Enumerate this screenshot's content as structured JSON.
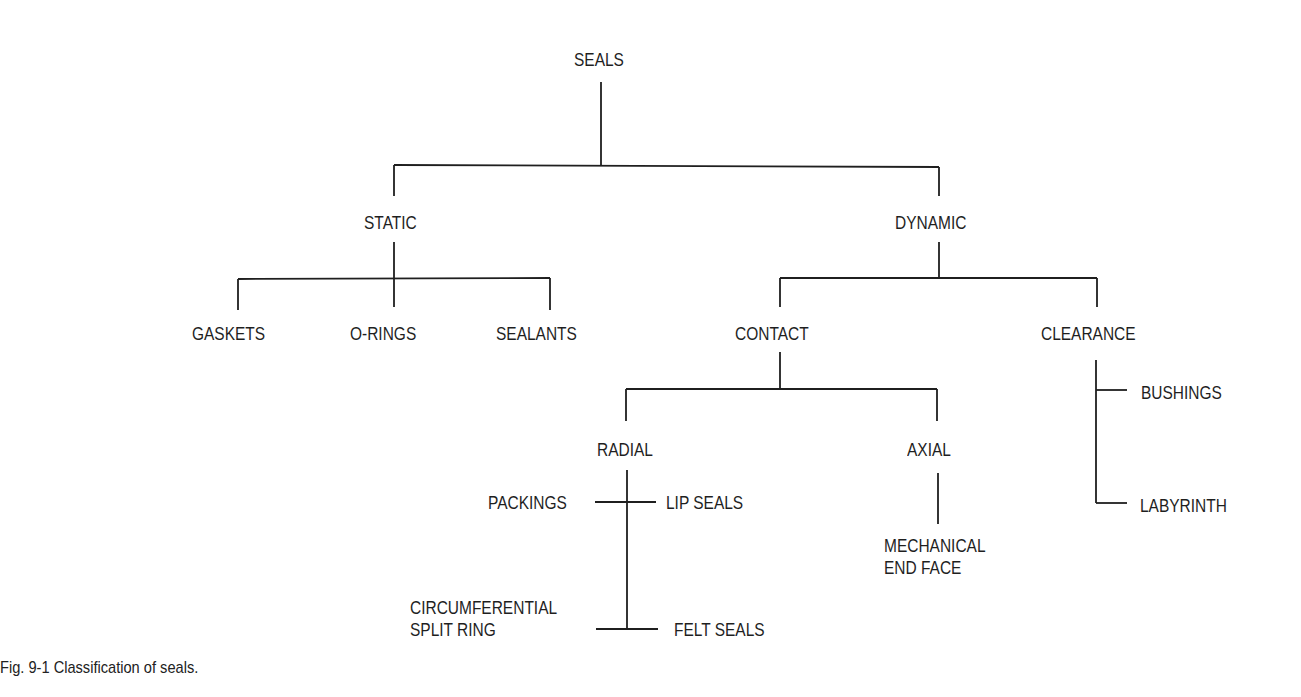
{
  "diagram": {
    "type": "tree",
    "root": "SEALS",
    "nodes": {
      "seals": "SEALS",
      "static": "STATIC",
      "dynamic": "DYNAMIC",
      "gaskets": "GASKETS",
      "o_rings": "O-RINGS",
      "sealants": "SEALANTS",
      "contact": "CONTACT",
      "clearance": "CLEARANCE",
      "radial": "RADIAL",
      "axial": "AXIAL",
      "bushings": "BUSHINGS",
      "labyrinth": "LABYRINTH",
      "packings": "PACKINGS",
      "lip_seals": "LIP SEALS",
      "circumferential_line1": "CIRCUMFERENTIAL",
      "circumferential_line2": "SPLIT RING",
      "felt_seals": "FELT SEALS",
      "mechanical_line1": "MECHANICAL",
      "mechanical_line2": "END FACE"
    },
    "edges": [
      [
        "SEALS",
        "STATIC"
      ],
      [
        "SEALS",
        "DYNAMIC"
      ],
      [
        "STATIC",
        "GASKETS"
      ],
      [
        "STATIC",
        "O-RINGS"
      ],
      [
        "STATIC",
        "SEALANTS"
      ],
      [
        "DYNAMIC",
        "CONTACT"
      ],
      [
        "DYNAMIC",
        "CLEARANCE"
      ],
      [
        "CONTACT",
        "RADIAL"
      ],
      [
        "CONTACT",
        "AXIAL"
      ],
      [
        "CLEARANCE",
        "BUSHINGS"
      ],
      [
        "CLEARANCE",
        "LABYRINTH"
      ],
      [
        "RADIAL",
        "PACKINGS"
      ],
      [
        "RADIAL",
        "LIP SEALS"
      ],
      [
        "RADIAL",
        "CIRCUMFERENTIAL SPLIT RING"
      ],
      [
        "RADIAL",
        "FELT SEALS"
      ],
      [
        "AXIAL",
        "MECHANICAL END FACE"
      ]
    ]
  },
  "caption": "Fig. 9-1  Classification of seals."
}
